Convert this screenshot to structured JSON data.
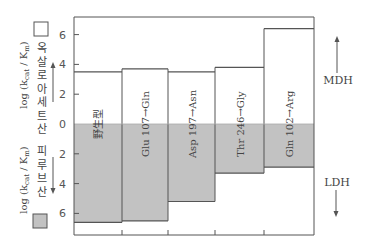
{
  "chart_data": {
    "type": "bar",
    "title": "",
    "categories": [
      "野生型",
      "Glu 107→Gln",
      "Asp 197→Asn",
      "Thr 246→Gly",
      "Gln 102→Arg"
    ],
    "series": [
      {
        "name": "옥살로아세트산",
        "direction": "up",
        "color": "#ffffff",
        "values": [
          3.5,
          3.7,
          3.5,
          3.8,
          6.4
        ]
      },
      {
        "name": "피루브산",
        "direction": "down",
        "color": "#c0c0c0",
        "values": [
          6.6,
          6.5,
          5.2,
          3.3,
          2.9
        ]
      }
    ],
    "ylabel_top": "log (kcat / Km) 옥살로아세트산",
    "ylabel_bottom": "log (kcat / Km) 피루브산",
    "yticks_up": [
      0,
      2,
      4,
      6
    ],
    "yticks_down": [
      2,
      4,
      6
    ],
    "ylim": [
      -7.4,
      7.2
    ],
    "right_labels": {
      "up": "MDH",
      "down": "LDH"
    },
    "grid": false
  },
  "labels": {
    "y_top_math": "log (k",
    "y_top_sub": "cat",
    "y_top_mid": " / K",
    "y_top_sub2": "m",
    "y_top_end": ")",
    "y_top_korean": "옥살로 아세트산",
    "y_bottom_korean": "피루브산",
    "mdh": "MDH",
    "ldh": "LDH"
  },
  "colors": {
    "up": "#ffffff",
    "down": "#c2c2c2",
    "line": "#555555"
  }
}
